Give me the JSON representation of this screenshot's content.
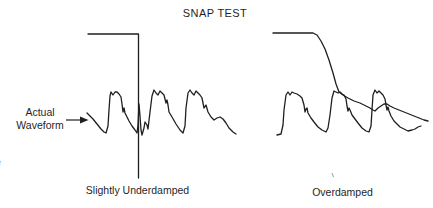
{
  "title": "SNAP TEST",
  "annotation": {
    "line1": "Actual",
    "line2": "Waveform"
  },
  "captions": {
    "left": "Slightly Underdamped",
    "right": "Overdamped"
  },
  "edge_fragment": "e",
  "colors": {
    "ink": "#1f1f1f",
    "faint": "#9a9a9a",
    "background": "#ffffff"
  },
  "diagram": {
    "traces": [
      {
        "name": "left-step-input",
        "stroke_width": 1.3,
        "points": [
          [
            88,
            34
          ],
          [
            138.5,
            34
          ],
          [
            138.5,
            178
          ]
        ]
      },
      {
        "name": "left-actual-waveform",
        "stroke_width": 1.3,
        "points": [
          [
            87,
            113
          ],
          [
            90,
            116
          ],
          [
            93,
            119
          ],
          [
            97,
            124
          ],
          [
            101,
            129
          ],
          [
            104,
            132
          ],
          [
            106,
            133
          ],
          [
            108,
            126
          ],
          [
            109,
            110
          ],
          [
            110,
            96
          ],
          [
            111,
            92
          ],
          [
            113,
            95
          ],
          [
            115,
            92
          ],
          [
            117,
            92
          ],
          [
            119,
            94
          ],
          [
            121,
            97
          ],
          [
            122,
            104
          ],
          [
            123,
            112
          ],
          [
            124,
            108
          ],
          [
            125,
            113
          ],
          [
            127,
            117
          ],
          [
            129,
            121
          ],
          [
            132,
            126
          ],
          [
            135,
            130
          ],
          [
            137,
            133
          ],
          [
            138,
            125
          ],
          [
            139,
            104
          ],
          [
            140,
            116
          ],
          [
            141,
            130
          ],
          [
            142,
            135
          ],
          [
            144,
            128
          ],
          [
            145,
            122
          ],
          [
            147,
            125
          ],
          [
            148,
            129
          ],
          [
            150,
            112
          ],
          [
            152,
            96
          ],
          [
            154,
            90
          ],
          [
            156,
            93
          ],
          [
            158,
            95
          ],
          [
            160,
            91
          ],
          [
            162,
            93
          ],
          [
            164,
            95
          ],
          [
            166,
            103
          ],
          [
            167,
            100
          ],
          [
            168,
            105
          ],
          [
            169,
            112
          ],
          [
            172,
            117
          ],
          [
            176,
            124
          ],
          [
            180,
            130
          ],
          [
            183,
            133
          ],
          [
            185,
            126
          ],
          [
            186,
            108
          ],
          [
            188,
            93
          ],
          [
            190,
            90
          ],
          [
            192,
            93
          ],
          [
            194,
            95
          ],
          [
            196,
            91
          ],
          [
            198,
            93
          ],
          [
            200,
            95
          ],
          [
            202,
            98
          ],
          [
            203,
            103
          ],
          [
            204,
            108
          ],
          [
            206,
            105
          ],
          [
            208,
            112
          ],
          [
            211,
            117
          ],
          [
            214,
            120
          ],
          [
            217,
            118
          ],
          [
            220,
            117
          ],
          [
            223,
            119
          ],
          [
            226,
            123
          ],
          [
            229,
            128
          ],
          [
            233,
            132
          ],
          [
            236,
            134
          ]
        ]
      },
      {
        "name": "right-step-response",
        "stroke_width": 1.3,
        "points": [
          [
            273,
            33
          ],
          [
            300,
            33
          ],
          [
            313,
            33
          ],
          [
            317,
            35
          ],
          [
            321,
            41
          ],
          [
            325,
            49
          ],
          [
            329,
            60
          ],
          [
            333,
            73
          ],
          [
            336,
            84
          ],
          [
            339,
            92
          ],
          [
            343,
            95
          ],
          [
            348,
            98
          ],
          [
            354,
            101
          ],
          [
            360,
            103
          ],
          [
            366,
            106
          ],
          [
            370,
            108
          ],
          [
            373,
            110
          ],
          [
            375,
            111
          ],
          [
            378,
            108
          ],
          [
            381,
            106
          ],
          [
            384,
            104
          ],
          [
            387,
            104
          ],
          [
            390,
            106
          ],
          [
            394,
            108
          ],
          [
            399,
            110
          ],
          [
            404,
            112
          ],
          [
            409,
            114
          ],
          [
            414,
            116
          ],
          [
            419,
            118
          ],
          [
            424,
            120
          ],
          [
            428,
            121
          ]
        ]
      },
      {
        "name": "right-actual-waveform",
        "stroke_width": 1.3,
        "points": [
          [
            277,
            135
          ],
          [
            281,
            134
          ],
          [
            283,
            125
          ],
          [
            284,
            110
          ],
          [
            286,
            95
          ],
          [
            288,
            92
          ],
          [
            290,
            95
          ],
          [
            292,
            92
          ],
          [
            294,
            93
          ],
          [
            297,
            94
          ],
          [
            300,
            96
          ],
          [
            302,
            98
          ],
          [
            304,
            105
          ],
          [
            305,
            112
          ],
          [
            306,
            109
          ],
          [
            307,
            108
          ],
          [
            308,
            113
          ],
          [
            311,
            118
          ],
          [
            314,
            122
          ],
          [
            318,
            127
          ],
          [
            322,
            130
          ],
          [
            326,
            132
          ],
          [
            328,
            128
          ],
          [
            330,
            115
          ],
          [
            332,
            98
          ],
          [
            334,
            91
          ],
          [
            336,
            92
          ],
          [
            338,
            93
          ],
          [
            340,
            92
          ],
          [
            342,
            94
          ],
          [
            344,
            95
          ],
          [
            346,
            99
          ],
          [
            347,
            106
          ],
          [
            348,
            111
          ],
          [
            349,
            108
          ],
          [
            350,
            110
          ],
          [
            352,
            115
          ],
          [
            355,
            119
          ],
          [
            358,
            123
          ],
          [
            362,
            128
          ],
          [
            366,
            131
          ],
          [
            369,
            132
          ],
          [
            371,
            126
          ],
          [
            372,
            110
          ],
          [
            373,
            95
          ],
          [
            375,
            90
          ],
          [
            377,
            93
          ],
          [
            379,
            91
          ],
          [
            381,
            93
          ],
          [
            383,
            95
          ],
          [
            385,
            99
          ],
          [
            386,
            105
          ],
          [
            387,
            110
          ],
          [
            388,
            107
          ],
          [
            389,
            111
          ],
          [
            391,
            116
          ],
          [
            394,
            121
          ],
          [
            397,
            124
          ],
          [
            400,
            127
          ],
          [
            404,
            129
          ],
          [
            408,
            131
          ],
          [
            412,
            130
          ],
          [
            415,
            129
          ],
          [
            418,
            127
          ],
          [
            421,
            126
          ]
        ]
      }
    ],
    "arrow": {
      "line": [
        [
          66,
          120
        ],
        [
          81,
          120
        ]
      ],
      "head": [
        [
          80,
          116.5
        ],
        [
          88.5,
          120
        ],
        [
          80,
          123.5
        ]
      ]
    },
    "tick": [
      [
        332,
        173
      ],
      [
        333.5,
        177
      ]
    ]
  }
}
